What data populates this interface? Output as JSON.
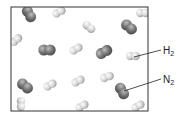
{
  "diagram": {
    "container": {
      "x": 11,
      "y": 7,
      "width": 137,
      "height": 104,
      "stroke": "#333333"
    },
    "labels": [
      {
        "base": "H",
        "sub": "2",
        "x": 163,
        "y": 46,
        "line": {
          "x1": 134,
          "y1": 57,
          "x2": 161,
          "y2": 50
        }
      },
      {
        "base": "N",
        "sub": "2",
        "x": 163,
        "y": 75,
        "line": {
          "x1": 124,
          "y1": 91,
          "x2": 161,
          "y2": 79
        }
      }
    ],
    "colors": {
      "N2": "#6f6f6f",
      "H2": "#d4d4d4",
      "outline": "#333333"
    },
    "molecules": [
      {
        "type": "N2",
        "cx": 29,
        "cy": 14,
        "angle": 60
      },
      {
        "type": "H2",
        "cx": 59,
        "cy": 12,
        "angle": -30
      },
      {
        "type": "H2",
        "cx": 143,
        "cy": 13,
        "angle": 0
      },
      {
        "type": "H2",
        "cx": 89,
        "cy": 27,
        "angle": 40
      },
      {
        "type": "N2",
        "cx": 129,
        "cy": 27,
        "angle": 40
      },
      {
        "type": "H2",
        "cx": 16,
        "cy": 40,
        "angle": -40
      },
      {
        "type": "N2",
        "cx": 47,
        "cy": 50,
        "angle": 0
      },
      {
        "type": "H2",
        "cx": 76,
        "cy": 49,
        "angle": -30
      },
      {
        "type": "N2",
        "cx": 104,
        "cy": 52,
        "angle": -30
      },
      {
        "type": "H2",
        "cx": 133,
        "cy": 56,
        "angle": 0
      },
      {
        "type": "N2",
        "cx": 25,
        "cy": 86,
        "angle": 40
      },
      {
        "type": "H2",
        "cx": 50,
        "cy": 85,
        "angle": -30
      },
      {
        "type": "H2",
        "cx": 78,
        "cy": 81,
        "angle": -30
      },
      {
        "type": "H2",
        "cx": 107,
        "cy": 77,
        "angle": -20
      },
      {
        "type": "N2",
        "cx": 122,
        "cy": 91,
        "angle": 60
      },
      {
        "type": "H2",
        "cx": 21,
        "cy": 104,
        "angle": 90
      },
      {
        "type": "H2",
        "cx": 82,
        "cy": 106,
        "angle": -30
      },
      {
        "type": "H2",
        "cx": 138,
        "cy": 106,
        "angle": -30
      }
    ]
  }
}
